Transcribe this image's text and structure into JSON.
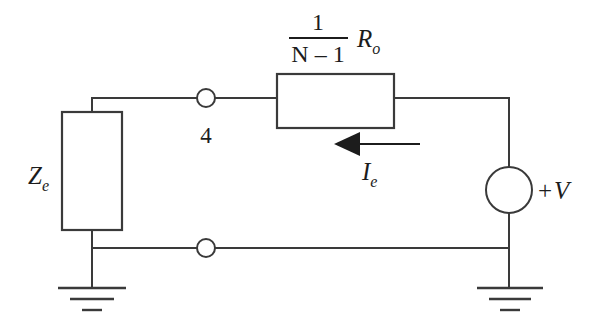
{
  "figure": {
    "type": "electrical-circuit-schematic",
    "background_color": "#ffffff",
    "line_color": "#3a3a3a",
    "text_color": "#1c1c1c"
  },
  "labels": {
    "impedance": {
      "symbol": "Z",
      "subscript": "e",
      "full": "Ze"
    },
    "resistor": {
      "fraction_numerator": "1",
      "fraction_denominator": "N – 1",
      "symbol": "R",
      "subscript": "o",
      "full": "1/(N-1) Ro"
    },
    "current": {
      "symbol": "I",
      "subscript": "e",
      "full": "Ie",
      "direction": "left"
    },
    "source": {
      "polarity": "+",
      "symbol": "V",
      "full": "+V"
    },
    "node": {
      "number": "4"
    }
  },
  "components": [
    {
      "name": "impedance-block",
      "label": "Ze"
    },
    {
      "name": "resistor-block",
      "label": "1/(N-1) Ro"
    },
    {
      "name": "voltage-source",
      "label": "+V"
    },
    {
      "name": "node-terminal-top",
      "label": "4"
    },
    {
      "name": "node-terminal-bottom",
      "label": ""
    },
    {
      "name": "ground-left",
      "label": ""
    },
    {
      "name": "ground-right",
      "label": ""
    },
    {
      "name": "current-arrow",
      "label": "Ie"
    }
  ]
}
